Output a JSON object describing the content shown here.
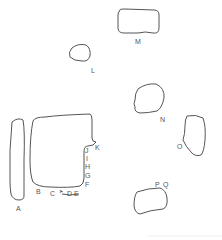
{
  "diagram": {
    "stroke_color": "#555555",
    "labels": {
      "A": "A",
      "B": "B",
      "C": "C",
      "D": "D",
      "E": "E",
      "F": "F",
      "G": "G",
      "H": "H",
      "I": "I",
      "J": "J",
      "K": "K",
      "L": "L",
      "M": "M",
      "N": "N",
      "O": "O",
      "P": "P",
      "Q": "Q"
    },
    "arrow": "➤"
  }
}
